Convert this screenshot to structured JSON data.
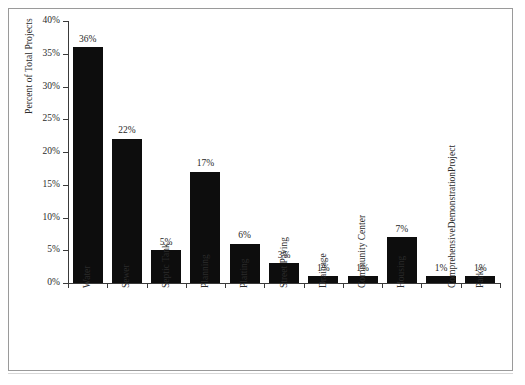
{
  "chart_data": {
    "type": "bar",
    "title": "",
    "subtitle": "",
    "xlabel": "",
    "ylabel": "Percent of Total Projects",
    "ylim": [
      0,
      40
    ],
    "ytick_labels": [
      "0%",
      "5%",
      "10%",
      "15%",
      "20%",
      "25%",
      "30%",
      "35%",
      "40%"
    ],
    "ytick_values": [
      0,
      5,
      10,
      15,
      20,
      25,
      30,
      35,
      40
    ],
    "grid": false,
    "legend": null,
    "bar_color": "#0d0d0d",
    "axis_color": "#3a3a3a",
    "value_suffix": "%",
    "categories": [
      "Water",
      "Sewer",
      "Septic Tank",
      "Planning",
      "Platting",
      "Street Paving",
      "Drainage",
      "Community Center",
      "Housing",
      "Comprehensive Demonstration Project",
      "Parks"
    ],
    "category_label_lines": [
      [
        "Water"
      ],
      [
        "Sewer"
      ],
      [
        "Septic Tank"
      ],
      [
        "Planning"
      ],
      [
        "Platting"
      ],
      [
        "Street Paving"
      ],
      [
        "Drainage"
      ],
      [
        "Community Center"
      ],
      [
        "Housing"
      ],
      [
        "Comprehensive",
        "Demonstration",
        "Project"
      ],
      [
        "Parks"
      ]
    ],
    "values": [
      36,
      22,
      5,
      17,
      6,
      3,
      1,
      1,
      7,
      1,
      1
    ],
    "data_labels": [
      "36%",
      "22%",
      "5%",
      "17%",
      "6%",
      "3%",
      "1%",
      "1%",
      "7%",
      "1%",
      "1%"
    ]
  }
}
